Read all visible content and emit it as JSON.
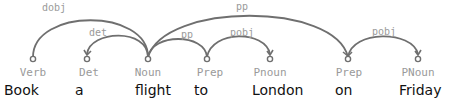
{
  "colors": {
    "arc": "#6f6f6f",
    "relation_label": "#9a9a9a",
    "pos_label": "#9a9a9a",
    "word": "#111111",
    "background": "#ffffff"
  },
  "tokens": [
    {
      "index": 0,
      "word": "Book",
      "pos": "Verb"
    },
    {
      "index": 1,
      "word": "a",
      "pos": "Det"
    },
    {
      "index": 2,
      "word": "flight",
      "pos": "Noun"
    },
    {
      "index": 3,
      "word": "to",
      "pos": "Prep"
    },
    {
      "index": 4,
      "word": "London",
      "pos": "Pnoun"
    },
    {
      "index": 5,
      "word": "on",
      "pos": "Prep"
    },
    {
      "index": 6,
      "word": "Friday",
      "pos": "PNoun"
    }
  ],
  "dependencies": [
    {
      "label": "dobj",
      "head": 2,
      "dependent": 0
    },
    {
      "label": "det",
      "head": 2,
      "dependent": 1
    },
    {
      "label": "pp",
      "head": 2,
      "dependent": 3
    },
    {
      "label": "pobj",
      "head": 3,
      "dependent": 4
    },
    {
      "label": "pp",
      "head": 2,
      "dependent": 5
    },
    {
      "label": "pobj",
      "head": 5,
      "dependent": 6
    }
  ]
}
